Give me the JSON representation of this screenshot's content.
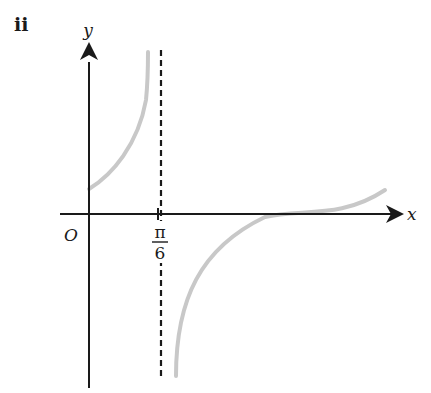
{
  "part_label": "ii",
  "axes": {
    "x_label": "x",
    "y_label": "y",
    "origin_label": "O"
  },
  "asymptote": {
    "label_numerator": "π",
    "label_denominator": "6",
    "style": "dashed"
  },
  "colors": {
    "axes": "#1a1a1a",
    "curve": "#c8c8c8",
    "asymptote": "#1a1a1a"
  }
}
